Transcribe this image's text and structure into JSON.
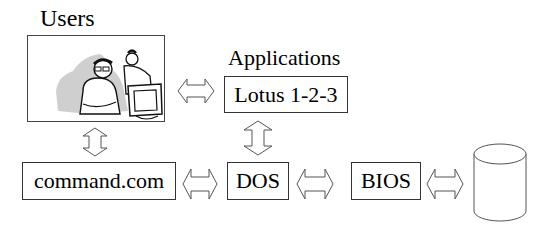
{
  "diagram": {
    "nodes": {
      "users": {
        "label": "Users",
        "image": "users-at-computer-clipart"
      },
      "applications": {
        "heading": "Applications",
        "label": "Lotus 1-2-3"
      },
      "shell": {
        "label": "command.com"
      },
      "os": {
        "label": "DOS"
      },
      "firmware": {
        "label": "BIOS"
      },
      "storage": {
        "label": "",
        "shape": "disk-cylinder"
      }
    },
    "edges": [
      {
        "from": "users",
        "to": "applications",
        "type": "bidirectional",
        "orientation": "horizontal"
      },
      {
        "from": "users",
        "to": "shell",
        "type": "bidirectional",
        "orientation": "vertical"
      },
      {
        "from": "applications",
        "to": "os",
        "type": "bidirectional",
        "orientation": "vertical"
      },
      {
        "from": "shell",
        "to": "os",
        "type": "bidirectional",
        "orientation": "horizontal"
      },
      {
        "from": "os",
        "to": "firmware",
        "type": "bidirectional",
        "orientation": "horizontal"
      },
      {
        "from": "firmware",
        "to": "storage",
        "type": "bidirectional",
        "orientation": "horizontal"
      }
    ]
  },
  "colors": {
    "line": "#333333",
    "shadow": "#c8c8c8",
    "background": "#ffffff"
  }
}
